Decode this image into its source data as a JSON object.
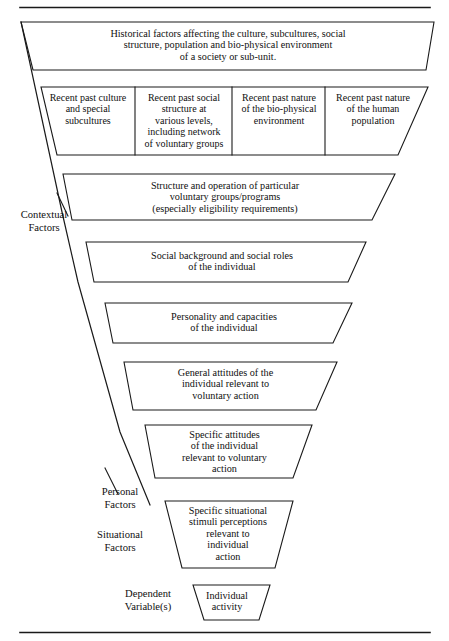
{
  "figure": {
    "type": "funnel-diagram",
    "top_rule": true,
    "bottom_rule": true,
    "levels": [
      {
        "id": "historical-factors",
        "shape": "trapezoid",
        "text": "Historical factors affecting the culture, subcultures, social\nstructure, population and bio-physical environment\nof a society or sub-unit."
      },
      {
        "id": "recent-past-row",
        "shape": "segmented-trapezoid",
        "cells": [
          {
            "id": "recent-past-culture",
            "text": "Recent past culture\nand special\nsubcultures"
          },
          {
            "id": "recent-past-social-structure",
            "text": "Recent past social\nstructure at\nvarious levels,\nincluding network\nof voluntary groups"
          },
          {
            "id": "recent-past-bio-physical",
            "text": "Recent past nature\nof the bio-physical\nenvironment"
          },
          {
            "id": "recent-past-human-population",
            "text": "Recent past nature\nof the human\npopulation"
          }
        ]
      },
      {
        "id": "structure-and-operation",
        "shape": "trapezoid",
        "text": "Structure and operation of particular\nvoluntary groups/programs\n(especially eligibility requirements)"
      },
      {
        "id": "social-background",
        "shape": "trapezoid",
        "text": "Social background and social roles\nof the individual"
      },
      {
        "id": "personality-and-capacities",
        "shape": "trapezoid",
        "text": "Personality and capacities\nof the individual"
      },
      {
        "id": "general-attitudes",
        "shape": "trapezoid",
        "text": "General attitudes of the\nindividual relevant to\nvoluntary action"
      },
      {
        "id": "specific-attitudes",
        "shape": "trapezoid",
        "text": "Specific attitudes\nof the individual\nrelevant to voluntary\naction"
      },
      {
        "id": "specific-situational-stimuli",
        "shape": "trapezoid",
        "text": "Specific  situational\nstimuli  perceptions\nrelevant to\nindividual\naction"
      },
      {
        "id": "individual-activity",
        "shape": "trapezoid",
        "text": "Individual\nactivity"
      }
    ],
    "side_labels": [
      {
        "id": "contextual-factors",
        "text": "Contextual\nFactors"
      },
      {
        "id": "personal-factors",
        "text": "Personal\nFactors"
      },
      {
        "id": "situational-factors",
        "text": "Situational\nFactors"
      },
      {
        "id": "dependent-variables",
        "text": "Dependent\nVariable(s)"
      }
    ],
    "colors": {
      "stroke": "#1a1a1a",
      "background": "#ffffff",
      "text": "#101010"
    }
  }
}
